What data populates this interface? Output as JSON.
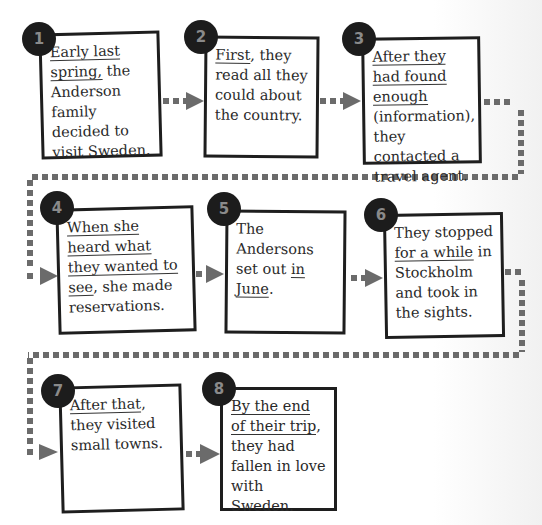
{
  "diagram": {
    "type": "sequence-flowchart",
    "connector_color": "#6b6b6b",
    "badge_color": "#1c1c1c",
    "steps": [
      {
        "number": "1",
        "parts": [
          {
            "text": "Early last spring,",
            "underline": true
          },
          {
            "text": " the Anderson family decided to visit Sweden.",
            "underline": false
          }
        ]
      },
      {
        "number": "2",
        "parts": [
          {
            "text": "First",
            "underline": true
          },
          {
            "text": ", they read all they could about the country.",
            "underline": false
          }
        ]
      },
      {
        "number": "3",
        "parts": [
          {
            "text": "After they had found enough",
            "underline": true
          },
          {
            "text": " (information), they contacted a travel agent.",
            "underline": false
          }
        ]
      },
      {
        "number": "4",
        "parts": [
          {
            "text": "When she heard what they wanted to see",
            "underline": true
          },
          {
            "text": ", she made reservations.",
            "underline": false
          }
        ]
      },
      {
        "number": "5",
        "parts": [
          {
            "text": "The Andersons set out ",
            "underline": false
          },
          {
            "text": "in June",
            "underline": true
          },
          {
            "text": ".",
            "underline": false
          }
        ]
      },
      {
        "number": "6",
        "parts": [
          {
            "text": "They stopped ",
            "underline": false
          },
          {
            "text": "for a while",
            "underline": true
          },
          {
            "text": " in Stockholm and took in the sights.",
            "underline": false
          }
        ]
      },
      {
        "number": "7",
        "parts": [
          {
            "text": "After that",
            "underline": true
          },
          {
            "text": ", they visited small towns.",
            "underline": false
          }
        ]
      },
      {
        "number": "8",
        "parts": [
          {
            "text": "By the end of their trip",
            "underline": true
          },
          {
            "text": ", they had fallen in love with Sweden.",
            "underline": false
          }
        ]
      }
    ],
    "step_texts": {
      "s1": "Early last spring, the Anderson family decided to visit Sweden.",
      "s2": "First, they read all they could about the country.",
      "s3": "After they had found enough (information), they contacted a travel agent.",
      "s4": "When she heard what they wanted to see, she made reservations.",
      "s5": "The Andersons set out in June.",
      "s6": "They stopped for a while in Stockholm and took in the sights.",
      "s7": "After that, they visited small towns.",
      "s8": "By the end of their trip, they had fallen in love with Sweden."
    }
  }
}
